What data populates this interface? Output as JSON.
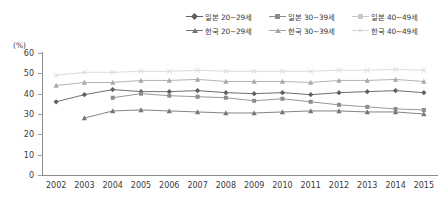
{
  "chart_data": {
    "type": "line",
    "title": "",
    "xlabel": "",
    "ylabel": "(%)",
    "unit_label": "(%)",
    "ylim": [
      0,
      60
    ],
    "ytick_values": [
      60,
      50,
      40,
      30,
      20,
      10,
      0
    ],
    "ytick_labels": [
      "60",
      "50",
      "40",
      "30",
      "20",
      "10",
      "0"
    ],
    "grid": false,
    "legend_position": "top-right",
    "categories": [
      "2002",
      "2003",
      "2004",
      "2005",
      "2006",
      "2007",
      "2008",
      "2009",
      "2010",
      "2011",
      "2012",
      "2013",
      "2014",
      "2015"
    ],
    "series": [
      {
        "name": "일본 20~29세",
        "marker": "diamond",
        "color": "#5f5f5f",
        "values": [
          36.0,
          39.5,
          42.0,
          41.0,
          41.0,
          41.5,
          40.5,
          40.0,
          40.5,
          39.5,
          40.5,
          41.0,
          41.5,
          40.5
        ]
      },
      {
        "name": "일본 30~39세",
        "marker": "square",
        "color": "#8c8c8c",
        "values": [
          null,
          null,
          38.0,
          40.0,
          39.0,
          38.5,
          38.0,
          36.5,
          37.5,
          36.0,
          34.5,
          33.5,
          32.5,
          32.0
        ]
      },
      {
        "name": "일본 40~49세",
        "marker": "square",
        "color": "#c9c9c9",
        "values": [
          null,
          null,
          null,
          null,
          null,
          null,
          null,
          null,
          null,
          null,
          null,
          null,
          null,
          null
        ]
      },
      {
        "name": "한국 20~29세",
        "marker": "triangle",
        "color": "#767676",
        "values": [
          null,
          28.0,
          31.5,
          32.0,
          31.5,
          31.0,
          30.5,
          30.5,
          31.0,
          31.5,
          31.5,
          31.0,
          31.0,
          30.0
        ]
      },
      {
        "name": "한국 30~39세",
        "marker": "triangle",
        "color": "#a9a9a9",
        "values": [
          44.0,
          45.5,
          45.5,
          46.5,
          46.5,
          47.0,
          46.0,
          46.0,
          46.0,
          45.5,
          46.5,
          46.5,
          47.0,
          46.0
        ]
      },
      {
        "name": "한국 40~49세",
        "marker": "x",
        "color": "#d8d8d8",
        "values": [
          49.0,
          50.5,
          50.5,
          51.0,
          51.0,
          51.5,
          51.0,
          51.0,
          51.0,
          51.0,
          51.5,
          51.5,
          52.0,
          51.5
        ]
      }
    ],
    "legend_entries": [
      {
        "label": "일본 20~29세",
        "marker": "diamond",
        "color": "#5f5f5f"
      },
      {
        "label": "일본 30~39세",
        "marker": "square",
        "color": "#8c8c8c"
      },
      {
        "label": "일본 40~49세",
        "marker": "square",
        "color": "#c9c9c9"
      },
      {
        "label": "한국 20~29세",
        "marker": "triangle",
        "color": "#767676"
      },
      {
        "label": "한국 30~39세",
        "marker": "triangle",
        "color": "#a9a9a9"
      },
      {
        "label": "한국 40~49세",
        "marker": "x",
        "color": "#d8d8d8"
      }
    ]
  }
}
